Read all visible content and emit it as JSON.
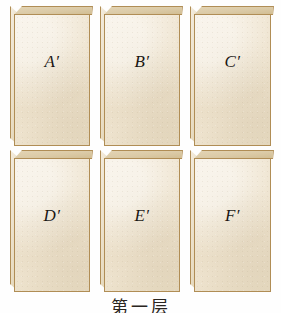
{
  "figure": {
    "caption": "第一层",
    "colors": {
      "block_fill": "#ece0c9",
      "block_outline": "#b08d55",
      "top_face": "#dbcaa6",
      "left_face": "#e9ddc4",
      "label_text": "#1b1712",
      "background": "#fefefe"
    },
    "rows": [
      {
        "row_name": "top-layer",
        "blocks": [
          {
            "label": "A",
            "prime": "′"
          },
          {
            "label": "B",
            "prime": "′"
          },
          {
            "label": "C",
            "prime": "′"
          }
        ]
      },
      {
        "row_name": "bottom-layer",
        "blocks": [
          {
            "label": "D",
            "prime": "′"
          },
          {
            "label": "E",
            "prime": "′"
          },
          {
            "label": "F",
            "prime": "′"
          }
        ]
      }
    ]
  }
}
